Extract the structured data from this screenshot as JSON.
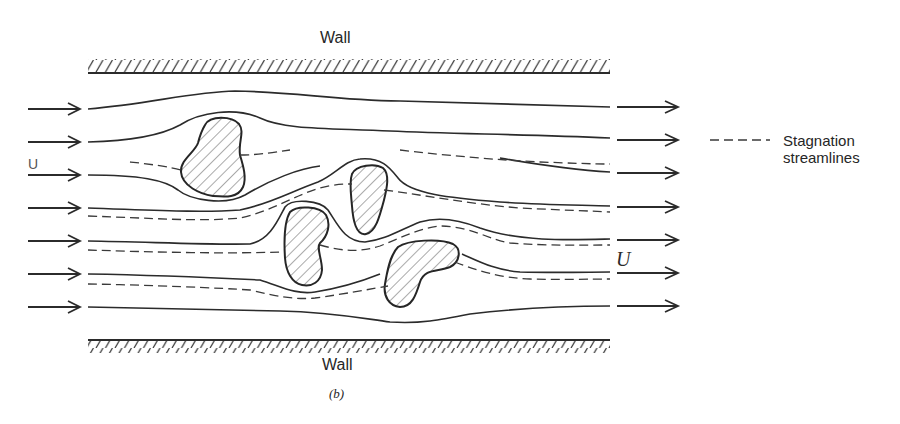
{
  "figure": {
    "caption": "(b)",
    "top_wall_label": "Wall",
    "bottom_wall_label": "Wall",
    "inlet_velocity_label": "U",
    "outlet_velocity_label": "U",
    "legend": {
      "line_style": "dashed",
      "line1": "Stagnation",
      "line2": "streamlines"
    },
    "inlet_arrow_count": 7,
    "outlet_arrow_count": 7,
    "obstacle_count": 4,
    "colors": {
      "ink": "#2b2b2b",
      "background": "#ffffff"
    }
  }
}
